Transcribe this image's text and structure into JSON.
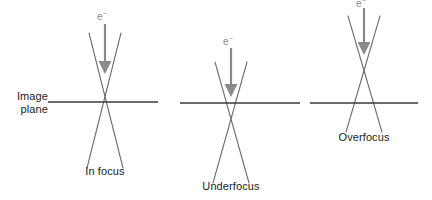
{
  "figure": {
    "type": "diagram",
    "background_color": "#ffffff",
    "colors": {
      "ray_line": "#6e6e6e",
      "image_plane_line": "#3a3a3a",
      "beam_arrow": "#8a8a8a",
      "caption_text": "#1c1c1c",
      "electron_label_text": "#8a8a8a"
    },
    "axis_label": {
      "line1": "Image",
      "line2": "plane"
    },
    "panels": [
      {
        "id": "in-focus",
        "caption": "In focus",
        "electron_label": "e",
        "electron_superscript": "−",
        "crossover_relative_to_plane": "on",
        "crossover_x": 105,
        "crossover_y": 102,
        "plane_x_start": 48,
        "plane_x_end": 158,
        "plane_y": 102,
        "cone_top_y": 33,
        "cone_bottom_y": 168,
        "cone_half_width_top": 16,
        "cone_half_width_bottom": 18,
        "arrow_x": 105,
        "arrow_top_y": 24,
        "arrow_tip_y": 73,
        "electron_label_x": 105,
        "electron_label_y": 10,
        "caption_x": 105,
        "caption_y": 165
      },
      {
        "id": "underfocus",
        "caption": "Underfocus",
        "electron_label": "e",
        "electron_superscript": "−",
        "crossover_relative_to_plane": "below",
        "crossover_x": 231,
        "crossover_y": 120,
        "plane_x_start": 180,
        "plane_x_end": 300,
        "plane_y": 103,
        "cone_top_y": 62,
        "cone_bottom_y": 183,
        "cone_half_width_top": 16,
        "cone_half_width_bottom": 18,
        "arrow_x": 231,
        "arrow_top_y": 48,
        "arrow_tip_y": 96,
        "electron_label_x": 231,
        "electron_label_y": 35,
        "caption_x": 231,
        "caption_y": 180
      },
      {
        "id": "overfocus",
        "caption": "Overfocus",
        "electron_label": "e",
        "electron_superscript": "−",
        "crossover_relative_to_plane": "above",
        "crossover_x": 364,
        "crossover_y": 77,
        "plane_x_start": 310,
        "plane_x_end": 418,
        "plane_y": 103,
        "cone_top_y": 16,
        "cone_bottom_y": 132,
        "cone_half_width_top": 16,
        "cone_half_width_bottom": 18,
        "arrow_x": 364,
        "arrow_top_y": 8,
        "arrow_tip_y": 54,
        "electron_label_x": 364,
        "electron_label_y": -4,
        "caption_x": 364,
        "caption_y": 131
      }
    ]
  }
}
